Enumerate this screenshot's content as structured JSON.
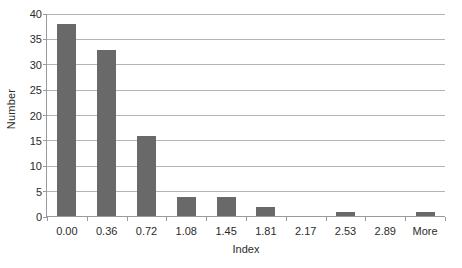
{
  "chart_data": {
    "type": "bar",
    "title": "",
    "subtitle": "",
    "xlabel": "Index",
    "ylabel": "Number",
    "categories": [
      "0.00",
      "0.36",
      "0.72",
      "1.08",
      "1.45",
      "1.81",
      "2.17",
      "2.53",
      "2.89",
      "More"
    ],
    "values": [
      38,
      33,
      16,
      4,
      4,
      2,
      0,
      1,
      0,
      1
    ],
    "ylim": [
      0,
      40
    ],
    "yticks": [
      0,
      5,
      10,
      15,
      20,
      25,
      30,
      35,
      40
    ],
    "ytick_labels": [
      "0",
      "5",
      "10",
      "15",
      "20",
      "25",
      "30",
      "35",
      "40"
    ],
    "grid": true,
    "grid_axis": "y",
    "legend": false,
    "legend_position": "none",
    "bar_color": "#696969",
    "gridline_color": "#b3b3b3",
    "axis_color": "#9a9a9a",
    "text_color": "#2b2b2b",
    "background_color": "#ffffff"
  }
}
